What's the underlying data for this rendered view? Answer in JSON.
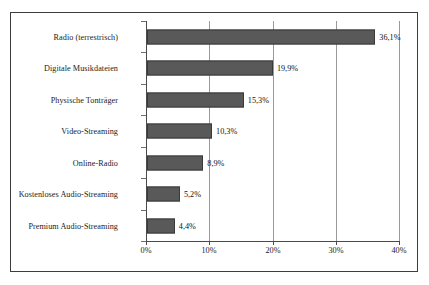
{
  "chart_data": {
    "type": "bar",
    "orientation": "horizontal",
    "title": "",
    "subtitle": "",
    "xlabel": "",
    "ylabel": "",
    "categories": [
      "Radio (terrestrisch)",
      "Digitale Musikdateien",
      "Physische Tonträger",
      "Video-Streaming",
      "Online-Radio",
      "Kostenloses Audio-Streaming",
      "Premium Audio-Streaming"
    ],
    "values": [
      36.1,
      19.9,
      15.3,
      10.3,
      8.9,
      5.2,
      4.4
    ],
    "value_labels": [
      "36,1%",
      "19,9%",
      "15,3%",
      "10,3%",
      "8,9%",
      "5,2%",
      "4,4%"
    ],
    "xlim": [
      0,
      40
    ],
    "xticks": [
      0,
      10,
      20,
      30,
      40
    ],
    "xtick_labels": [
      "0%",
      "10%",
      "20%",
      "30%",
      "40%"
    ],
    "grid": true,
    "grid_axis": "x",
    "legend": false,
    "legend_position": "none",
    "bar_color": "#595959",
    "bar_edge_color": "#3a3a3a",
    "grid_color": "#9a9a9a",
    "axis_color": "#4a4a4a",
    "text_color": "#1c1c1c",
    "background_color": "#ffffff",
    "frame_border_color": "#3d3d3d"
  }
}
